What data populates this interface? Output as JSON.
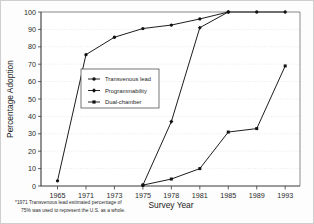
{
  "figure": {
    "background_color": "#fdfdfd",
    "frame_color": "#cfcfcf",
    "series_color": "#111111"
  },
  "footnote": {
    "line1": "*1971 Transvenous lead estimated percentage of",
    "line2": "75% was used to represent the U.S. as a whole."
  },
  "chart_data": {
    "type": "line",
    "title": "",
    "xlabel": "Survey Year",
    "ylabel": "Percentage Adoption",
    "categories": [
      "1965",
      "1971",
      "1973",
      "1975",
      "1978",
      "1981",
      "1985",
      "1989",
      "1993"
    ],
    "ylim": [
      0,
      100
    ],
    "yticks": [
      0,
      10,
      20,
      30,
      40,
      50,
      60,
      70,
      80,
      90,
      100
    ],
    "ytick_labels": [
      "0",
      "10",
      "20",
      "30",
      "40",
      "50",
      "60",
      "70",
      "80",
      "90",
      "100"
    ],
    "grid": true,
    "grid_axis": "y",
    "legend_position": "center-left-inside",
    "series": [
      {
        "name": "Transvenous lead",
        "marker": "circle",
        "values": [
          3,
          75.5,
          85.5,
          90.5,
          92.5,
          96,
          100,
          100,
          100
        ]
      },
      {
        "name": "Programmability",
        "marker": "diamond",
        "values": [
          null,
          null,
          null,
          0.5,
          37,
          91,
          100,
          null,
          null
        ]
      },
      {
        "name": "Dual-chamber",
        "marker": "square",
        "values": [
          null,
          null,
          null,
          0.5,
          4,
          10,
          31,
          33,
          69
        ]
      }
    ]
  }
}
